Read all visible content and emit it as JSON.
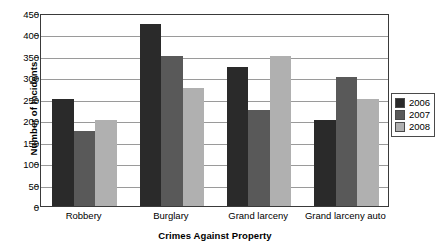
{
  "chart_data": {
    "type": "bar",
    "title": "",
    "xlabel": "Crimes Against Property",
    "ylabel": "Number of Incidents",
    "categories": [
      "Robbery",
      "Burglary",
      "Grand larceny",
      "Grand larceny auto"
    ],
    "series": [
      {
        "name": "2006",
        "color": "#2a2a2a",
        "values": [
          250,
          425,
          325,
          200
        ]
      },
      {
        "name": "2007",
        "color": "#595959",
        "values": [
          175,
          350,
          225,
          300
        ]
      },
      {
        "name": "2008",
        "color": "#b0b0b0",
        "values": [
          200,
          275,
          350,
          250
        ]
      }
    ],
    "ylim": [
      0,
      450
    ],
    "ytick_step": 50,
    "yticks": [
      0,
      50,
      100,
      150,
      200,
      250,
      300,
      350,
      400,
      450
    ],
    "ytick_labels": [
      "0",
      "50",
      "100",
      "150",
      "200",
      "250",
      "300",
      "350",
      "400",
      "450"
    ],
    "grid": true,
    "grid_axis": "y",
    "legend_position": "right",
    "legend_entries": [
      "2006",
      "2007",
      "2008"
    ]
  },
  "colors": {
    "series_2006": "#2a2a2a",
    "series_2007": "#595959",
    "series_2008": "#b0b0b0",
    "axis": "#3a3a3a",
    "gridline": "#9a9a9a",
    "background": "#ffffff",
    "text": "#000000"
  }
}
